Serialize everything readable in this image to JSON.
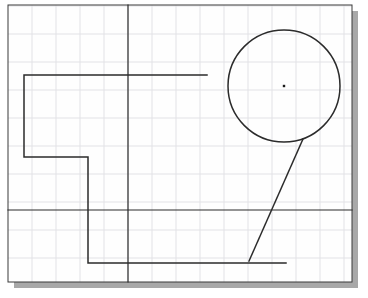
{
  "document": {
    "type": "cad-sketch-canvas",
    "title": "CAD sketch drawing area",
    "description": "Technical drawing canvas with a light grid, two construction reference lines, a stepped polyline profile, a circle with a center point marker, and a tangent diagonal line."
  },
  "canvas": {
    "width": 368,
    "height": 298,
    "background_color": "#ffffff",
    "frame": {
      "x": 8,
      "y": 5,
      "width": 344,
      "height": 277,
      "border_color": "#3a3a3a",
      "border_width": 1,
      "fill": "#fefefe"
    },
    "drop_shadow": {
      "color": "#a8a8a8",
      "offset_x": 6,
      "offset_y": 6,
      "visible": true
    }
  },
  "grid": {
    "visible": true,
    "color": "#e2e2e6",
    "line_width": 1,
    "spacing_x": 24,
    "spacing_y": 28,
    "origin_x": 8,
    "origin_y": 6,
    "vertical_lines": [
      8,
      32,
      56,
      80,
      104,
      128,
      152,
      176,
      200,
      224,
      248,
      272,
      296,
      320,
      344
    ],
    "horizontal_lines": [
      6,
      34,
      62,
      90,
      118,
      146,
      174,
      202,
      230,
      258,
      282
    ]
  },
  "geometry": {
    "stroke_color": "#2b2b2b",
    "stroke_width": 1.4,
    "entities": [
      {
        "id": "reference-vertical",
        "name": "vertical-reference-line",
        "type": "line",
        "x1": 128,
        "y1": 5,
        "x2": 128,
        "y2": 282,
        "stroke_width": 1.2
      },
      {
        "id": "reference-horizontal",
        "name": "horizontal-reference-line",
        "type": "line",
        "x1": 8,
        "y1": 210,
        "x2": 352,
        "y2": 210,
        "stroke_width": 1.2
      },
      {
        "id": "stepped-profile",
        "name": "stepped-polyline-profile",
        "type": "polyline",
        "points": [
          [
            207,
            75
          ],
          [
            24,
            75
          ],
          [
            24,
            157
          ],
          [
            88,
            157
          ],
          [
            88,
            263
          ],
          [
            286,
            263
          ]
        ],
        "stroke_width": 1.5
      },
      {
        "id": "circle-main",
        "name": "circle",
        "type": "circle",
        "cx": 284,
        "cy": 86,
        "r": 56,
        "stroke_width": 1.5,
        "fill": "none"
      },
      {
        "id": "circle-center-point",
        "name": "circle-center-point",
        "type": "point",
        "cx": 284,
        "cy": 86,
        "size": 2.4,
        "fill": "#1a1a1a"
      },
      {
        "id": "tangent-diagonal",
        "name": "tangent-diagonal-line",
        "type": "line",
        "x1": 303,
        "y1": 139,
        "x2": 249,
        "y2": 261,
        "stroke_width": 1.5
      }
    ]
  },
  "labels": {
    "circle_label": "",
    "dimension_text": "",
    "status_text": ""
  }
}
